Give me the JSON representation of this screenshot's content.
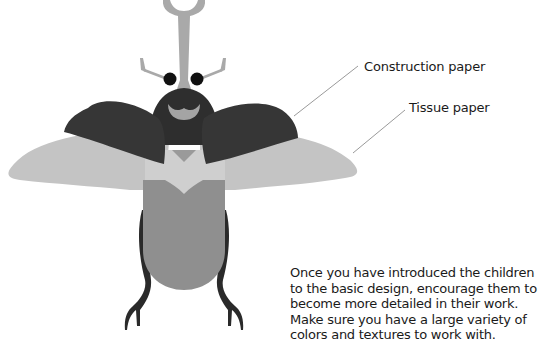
{
  "labels": {
    "construction_paper": "Construction paper",
    "tissue_paper": "Tissue paper"
  },
  "caption": "Once you have introduced the children to the basic design, encourage them to become more detailed in their work. Make sure you have a large variety of colors and textures to work with.",
  "illustration": {
    "subject": "beetle-craft",
    "colors": {
      "horn": "#a9a9a9",
      "head": "#2e2e2e",
      "eye": "#111111",
      "mouth": "#a4a4a4",
      "upper_wing": "#363636",
      "lower_wing": "#c4c4c4",
      "thorax": "#cfcfcf",
      "abdomen": "#8f8f8f",
      "legs": "#2a2a2a",
      "leader_line": "#9a9a9a"
    }
  }
}
